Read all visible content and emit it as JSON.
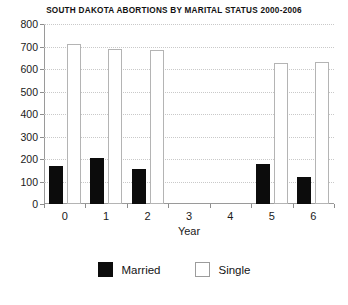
{
  "chart_data": {
    "type": "bar",
    "title": "SOUTH DAKOTA ABORTIONS BY MARITAL STATUS 2000-2006",
    "xlabel": "Year",
    "ylabel": "",
    "categories": [
      "0",
      "1",
      "2",
      "3",
      "4",
      "5",
      "6"
    ],
    "series": [
      {
        "name": "Married",
        "color": "#0c0c0c",
        "values": [
          170,
          205,
          155,
          0,
          0,
          180,
          120
        ]
      },
      {
        "name": "Single",
        "color": "#ffffff",
        "values": [
          710,
          690,
          685,
          0,
          0,
          625,
          630
        ]
      }
    ],
    "ylim": [
      0,
      800
    ],
    "yticks": [
      0,
      100,
      200,
      300,
      400,
      500,
      600,
      700,
      800
    ],
    "ytick_labels": [
      "0",
      "100",
      "200",
      "300",
      "400",
      "500",
      "600",
      "700",
      "800"
    ],
    "grid": true,
    "legend_position": "bottom"
  },
  "legend": {
    "items": [
      {
        "label": "Married",
        "style": "filled"
      },
      {
        "label": "Single",
        "style": "hollow"
      }
    ]
  }
}
